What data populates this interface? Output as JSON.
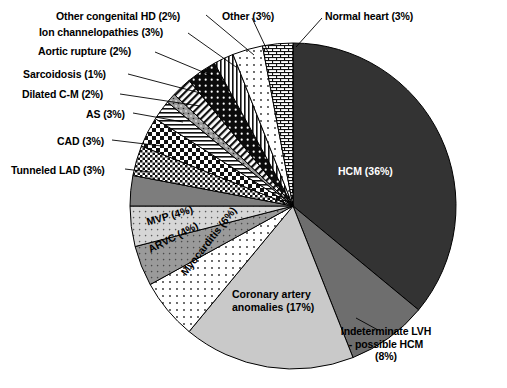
{
  "chart_data": {
    "type": "pie",
    "title": "",
    "subtitle": "",
    "xlabel": "",
    "ylabel": "",
    "legend_position": "none",
    "grid": false,
    "total_percent": 100,
    "center": {
      "x": 293,
      "y": 206
    },
    "radius": 163,
    "start_angle_deg": -90,
    "direction": "clockwise",
    "categories": [
      "HCM",
      "Indeterminate LVH - possible HCM",
      "Coronary artery anomalies",
      "Myocarditis",
      "ARVC",
      "MVP",
      "Tunneled LAD",
      "CAD",
      "AS",
      "Dilated C-M",
      "Sarcoidosis",
      "Aortic rupture",
      "Ion channelopathies",
      "Other congenital HD",
      "Other",
      "Normal heart"
    ],
    "values": [
      36,
      8,
      17,
      6,
      4,
      4,
      3,
      3,
      3,
      2,
      1,
      2,
      3,
      2,
      3,
      3
    ],
    "slices": [
      {
        "label": "HCM",
        "percent": 36,
        "text": "HCM (36%)",
        "fill": "#333333",
        "pattern": "solid-dark",
        "placement": "inside",
        "text_color": "#ffffff"
      },
      {
        "label": "Indeterminate LVH - possible HCM",
        "percent": 8,
        "text": "Indeterminate LVH\n- possible HCM\n(8%)",
        "fill": "#6e6e6e",
        "pattern": "solid-midgray",
        "placement": "outside",
        "text_color": "#000000"
      },
      {
        "label": "Coronary artery anomalies",
        "percent": 17,
        "text": "Coronary artery\nanomalies (17%)",
        "fill": "#c9c9c9",
        "pattern": "solid-lightgray",
        "placement": "inside",
        "text_color": "#000000"
      },
      {
        "label": "Myocarditis",
        "percent": 6,
        "text": "Myocarditis (6%)",
        "fill": "#f2f2f2",
        "pattern": "dots-sparse",
        "placement": "inside-rotated",
        "text_color": "#000000"
      },
      {
        "label": "ARVC",
        "percent": 4,
        "text": "ARVC (4%)",
        "fill": "#9a9a9a",
        "pattern": "dots-on-gray",
        "placement": "inside-rotated",
        "text_color": "#000000"
      },
      {
        "label": "MVP",
        "percent": 4,
        "text": "MVP (4%)",
        "fill": "#d6d6d6",
        "pattern": "dots-on-lightgray",
        "placement": "inside-rotated",
        "text_color": "#000000"
      },
      {
        "label": "Tunneled LAD",
        "percent": 3,
        "text": "Tunneled LAD (3%)",
        "fill": "#7d7d7d",
        "pattern": "solid-gray",
        "placement": "outside",
        "text_color": "#000000"
      },
      {
        "label": "CAD",
        "percent": 3,
        "text": "CAD (3%)",
        "fill": "#ffffff",
        "pattern": "checker-fine",
        "placement": "outside",
        "text_color": "#000000"
      },
      {
        "label": "AS",
        "percent": 3,
        "text": "AS (3%)",
        "fill": "#ffffff",
        "pattern": "checker-coarse",
        "placement": "outside",
        "text_color": "#000000"
      },
      {
        "label": "Dilated C-M",
        "percent": 2,
        "text": "Dilated C-M (2%)",
        "fill": "#ffffff",
        "pattern": "hlines",
        "placement": "outside",
        "text_color": "#000000"
      },
      {
        "label": "Sarcoidosis",
        "percent": 1,
        "text": "Sarcoidosis (1%)",
        "fill": "#9a9a9a",
        "pattern": "speckle-gray",
        "placement": "outside",
        "text_color": "#000000"
      },
      {
        "label": "Aortic rupture",
        "percent": 2,
        "text": "Aortic rupture (2%)",
        "fill": "#ffffff",
        "pattern": "diag-lines",
        "placement": "outside",
        "text_color": "#000000"
      },
      {
        "label": "Ion channelopathies",
        "percent": 3,
        "text": "Ion channelopathies (3%)",
        "fill": "#000000",
        "pattern": "dots-on-black",
        "placement": "outside",
        "text_color": "#000000"
      },
      {
        "label": "Other congenital HD",
        "percent": 2,
        "text": "Other congenital HD (2%)",
        "fill": "#ffffff",
        "pattern": "vlines",
        "placement": "outside",
        "text_color": "#000000"
      },
      {
        "label": "Other",
        "percent": 3,
        "text": "Other (3%)",
        "fill": "#ffffff",
        "pattern": "dots-sparse-white",
        "placement": "outside",
        "text_color": "#000000"
      },
      {
        "label": "Normal heart",
        "percent": 3,
        "text": "Normal heart (3%)",
        "fill": "#ffffff",
        "pattern": "brick",
        "placement": "outside",
        "text_color": "#000000"
      }
    ],
    "outside_labels": [
      {
        "name": "other-congenital-hd",
        "text": "Other congenital HD (2%)",
        "x": 56,
        "y": 10,
        "align": "left"
      },
      {
        "name": "ion-channelopathies",
        "text": "Ion channelopathies (3%)",
        "x": 39,
        "y": 26,
        "align": "left"
      },
      {
        "name": "aortic-rupture",
        "text": "Aortic rupture (2%)",
        "x": 38,
        "y": 45,
        "align": "left"
      },
      {
        "name": "sarcoidosis",
        "text": "Sarcoidosis (1%)",
        "x": 23,
        "y": 68,
        "align": "left"
      },
      {
        "name": "dilated-cm",
        "text": "Dilated C-M (2%)",
        "x": 22,
        "y": 88,
        "align": "left"
      },
      {
        "name": "as",
        "text": "AS (3%)",
        "x": 86,
        "y": 108,
        "align": "left"
      },
      {
        "name": "cad",
        "text": "CAD (3%)",
        "x": 57,
        "y": 135,
        "align": "left"
      },
      {
        "name": "tunneled-lad",
        "text": "Tunneled LAD (3%)",
        "x": 11,
        "y": 164,
        "align": "left"
      },
      {
        "name": "other",
        "text": "Other (3%)",
        "x": 222,
        "y": 10,
        "align": "left"
      },
      {
        "name": "normal-heart",
        "text": "Normal heart (3%)",
        "x": 325,
        "y": 10,
        "align": "left"
      }
    ],
    "inside_labels": [
      {
        "name": "hcm",
        "text": "HCM (36%)",
        "x": 338,
        "y": 165,
        "rotate": 0,
        "color": "#ffffff"
      },
      {
        "name": "coronary-artery-anomalies-line1",
        "text": "Coronary artery",
        "x": 232,
        "y": 288,
        "rotate": 0,
        "color": "#000000"
      },
      {
        "name": "coronary-artery-anomalies-line2",
        "text": "anomalies (17%)",
        "x": 232,
        "y": 301,
        "rotate": 0,
        "color": "#000000"
      },
      {
        "name": "myocarditis",
        "text": "Myocarditis (6%)",
        "x": 178,
        "y": 270,
        "rotate": -52,
        "color": "#000000"
      },
      {
        "name": "arvc",
        "text": "ARVC (4%)",
        "x": 146,
        "y": 244,
        "rotate": -27,
        "color": "#000000"
      },
      {
        "name": "mvp",
        "text": "MVP (4%)",
        "x": 145,
        "y": 216,
        "rotate": -16,
        "color": "#000000"
      }
    ],
    "indeterminate_label": {
      "name": "indeterminate-lvh",
      "line1": "Indeterminate LVH",
      "line2": "- possible HCM",
      "line3": "(8%)",
      "x": 386,
      "y": 337
    },
    "leader_lines": [
      {
        "name": "leader-other-congenital-hd",
        "x1": 206,
        "y1": 15,
        "x2": 254,
        "y2": 55
      },
      {
        "name": "leader-ion-channelopathies",
        "x1": 188,
        "y1": 33,
        "x2": 236,
        "y2": 67
      },
      {
        "name": "leader-aortic-rupture",
        "x1": 155,
        "y1": 52,
        "x2": 222,
        "y2": 80
      },
      {
        "name": "leader-sarcoidosis",
        "x1": 128,
        "y1": 74,
        "x2": 208,
        "y2": 95
      },
      {
        "name": "leader-dilated-cm",
        "x1": 120,
        "y1": 94,
        "x2": 200,
        "y2": 106
      },
      {
        "name": "leader-as",
        "x1": 133,
        "y1": 113,
        "x2": 183,
        "y2": 122
      },
      {
        "name": "leader-cad",
        "x1": 112,
        "y1": 140,
        "x2": 162,
        "y2": 146
      },
      {
        "name": "leader-tunneled-lad",
        "x1": 125,
        "y1": 169,
        "x2": 150,
        "y2": 172
      },
      {
        "name": "leader-other",
        "x1": 252,
        "y1": 18,
        "x2": 268,
        "y2": 52
      },
      {
        "name": "leader-normal-heart",
        "x1": 322,
        "y1": 18,
        "x2": 296,
        "y2": 47
      },
      {
        "name": "leader-indeterminate-lvh",
        "x1": 378,
        "y1": 330,
        "x2": 356,
        "y2": 318
      }
    ]
  }
}
